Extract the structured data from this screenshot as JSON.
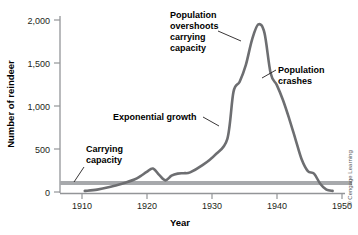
{
  "figure": {
    "background_color": "#ffffff",
    "curve_color": "#6d6e71",
    "capacity_line_color": "#a7a9ac",
    "axis_color": "#939598",
    "text_color": "#231f20",
    "credit": "© Cengage Learning"
  },
  "chart_data": {
    "type": "line",
    "title": "",
    "xlabel": "Year",
    "ylabel": "Number of reindeer",
    "xlim": [
      1906,
      1952
    ],
    "ylim": [
      0,
      2100
    ],
    "xticks": [
      1910,
      1920,
      1930,
      1940,
      1950
    ],
    "xtick_labels": [
      "1910",
      "1920",
      "1930",
      "1940",
      "1950"
    ],
    "yticks": [
      0,
      500,
      1000,
      1500,
      2000
    ],
    "ytick_labels": [
      "0",
      "500",
      "1,000",
      "1,500",
      "2,000"
    ],
    "grid": false,
    "legend": "none",
    "series": [
      {
        "name": "Reindeer population",
        "color": "#6d6e71",
        "x": [
          1910,
          1912,
          1914,
          1916,
          1918,
          1919,
          1920,
          1921,
          1922,
          1923,
          1924,
          1925,
          1926,
          1927,
          1929,
          1931,
          1933,
          1934,
          1935,
          1936,
          1937,
          1938,
          1939,
          1940,
          1941,
          1942,
          1943,
          1944,
          1945,
          1946,
          1947,
          1948,
          1949,
          1950
        ],
        "y": [
          25,
          40,
          70,
          110,
          160,
          200,
          250,
          290,
          215,
          150,
          205,
          230,
          235,
          245,
          330,
          450,
          640,
          1200,
          1320,
          1520,
          1820,
          2000,
          1900,
          1420,
          1280,
          1100,
          880,
          640,
          400,
          260,
          230,
          110,
          40,
          25
        ]
      }
    ],
    "reference_lines": [
      {
        "name": "carrying-capacity",
        "orientation": "horizontal",
        "value": 110,
        "color": "#a7a9ac",
        "width_px": 4
      }
    ],
    "annotations": [
      {
        "name": "carrying-capacity-label",
        "lines": [
          "Carrying",
          "capacity"
        ],
        "text_x": 86,
        "text_y": 152,
        "leader": {
          "x1": 84,
          "y1": 166,
          "x2": 74,
          "y2": 184
        }
      },
      {
        "name": "exponential-growth-label",
        "lines": [
          "Exponential growth"
        ],
        "text_x": 113,
        "text_y": 120,
        "leader": {
          "x1": 202,
          "y1": 117,
          "x2": 218,
          "y2": 125
        }
      },
      {
        "name": "population-overshoots-label",
        "lines": [
          "Population",
          "overshoots",
          "carrying",
          "capacity"
        ],
        "text_x": 170,
        "text_y": 18,
        "leader": {
          "x1": 216,
          "y1": 33,
          "x2": 240,
          "y2": 40
        }
      },
      {
        "name": "population-crashes-label",
        "lines": [
          "Population",
          "crashes"
        ],
        "text_x": 278,
        "text_y": 70,
        "leader": {
          "x1": 276,
          "y1": 73,
          "x2": 262,
          "y2": 80
        }
      }
    ]
  }
}
